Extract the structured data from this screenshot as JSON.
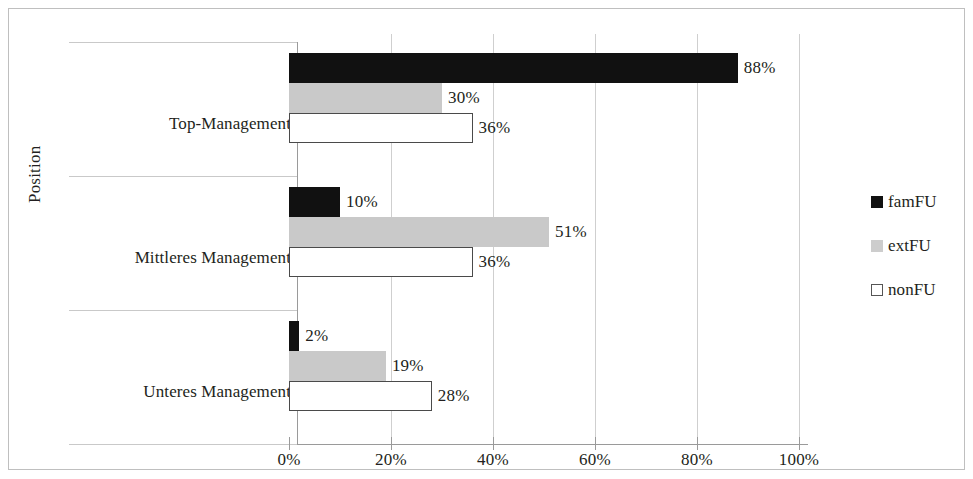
{
  "chart_data": {
    "type": "bar",
    "orientation": "horizontal",
    "title": "",
    "xlabel": "",
    "ylabel": "Position",
    "xlim": [
      0,
      100
    ],
    "xticks": [
      "0%",
      "20%",
      "40%",
      "60%",
      "80%",
      "100%"
    ],
    "xtick_values": [
      0,
      20,
      40,
      60,
      80,
      100
    ],
    "grid": true,
    "legend_position": "right",
    "categories": [
      "Top-Management",
      "Mittleres Management",
      "Unteres Management"
    ],
    "series": [
      {
        "name": "famFU",
        "color": "#111111",
        "values": [
          88,
          10,
          2
        ],
        "labels": [
          "88%",
          "10%",
          "2%"
        ]
      },
      {
        "name": "extFU",
        "color": "#c9c9c9",
        "values": [
          30,
          51,
          19
        ],
        "labels": [
          "30%",
          "51%",
          "19%"
        ]
      },
      {
        "name": "nonFU",
        "color": "#ffffff",
        "values": [
          36,
          36,
          28
        ],
        "labels": [
          "36%",
          "36%",
          "28%"
        ]
      }
    ]
  },
  "axis": {
    "y_title": "Position"
  },
  "legend": {
    "items": [
      {
        "label": "famFU",
        "marker": "filled-square-black-icon"
      },
      {
        "label": "extFU",
        "marker": "filled-square-gray-icon"
      },
      {
        "label": "nonFU",
        "marker": "outlined-square-white-icon"
      }
    ]
  }
}
